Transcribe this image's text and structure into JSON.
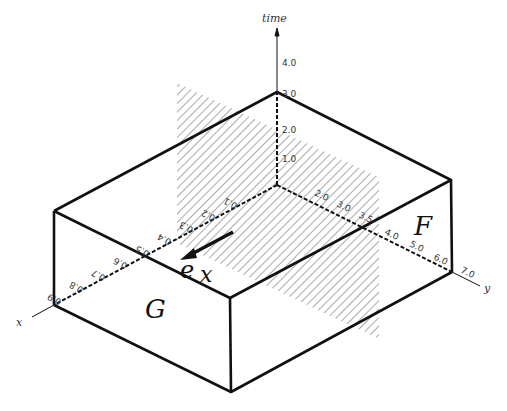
{
  "diagram": {
    "axes": {
      "time": {
        "label": "time",
        "ticks": [
          "1.0",
          "2.0",
          "3.0",
          "4.0"
        ]
      },
      "y": {
        "label": "y",
        "ticks": [
          "2.0",
          "3.0",
          "3.5",
          "4.0",
          "5.0",
          "6.0",
          "7.0"
        ]
      },
      "x": {
        "label": "x",
        "ticks": [
          "0.5",
          "0.4",
          "0.3",
          "0.2",
          "0.1",
          "0.6",
          "0.7",
          "0.8",
          "0.9"
        ]
      }
    },
    "faces": {
      "front_left": "G",
      "front_right": "F"
    },
    "vector_label": "e",
    "vector_subscript": "x",
    "colors": {
      "line": "#111111",
      "hatch": "#555555",
      "background": "#ffffff"
    }
  }
}
